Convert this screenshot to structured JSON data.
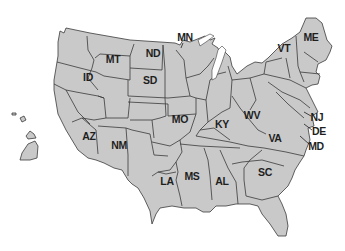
{
  "map": {
    "title": "United States map (simplified, distorted)",
    "fill_color": "#c9c9c9",
    "border_color": "#3a3a3a",
    "label_color": "#1e1e1e",
    "labels": [
      {
        "code": "MN",
        "x": 185,
        "y": 37
      },
      {
        "code": "MT",
        "x": 113,
        "y": 59
      },
      {
        "code": "ND",
        "x": 153,
        "y": 53
      },
      {
        "code": "ID",
        "x": 88,
        "y": 77
      },
      {
        "code": "SD",
        "x": 150,
        "y": 80
      },
      {
        "code": "MO",
        "x": 180,
        "y": 119
      },
      {
        "code": "KY",
        "x": 222,
        "y": 124
      },
      {
        "code": "WV",
        "x": 252,
        "y": 115
      },
      {
        "code": "VT",
        "x": 284,
        "y": 48
      },
      {
        "code": "ME",
        "x": 311,
        "y": 37
      },
      {
        "code": "NJ",
        "x": 317,
        "y": 117
      },
      {
        "code": "DE",
        "x": 319,
        "y": 131
      },
      {
        "code": "MD",
        "x": 316,
        "y": 146
      },
      {
        "code": "VA",
        "x": 275,
        "y": 138
      },
      {
        "code": "AZ",
        "x": 89,
        "y": 136
      },
      {
        "code": "NM",
        "x": 119,
        "y": 145
      },
      {
        "code": "LA",
        "x": 167,
        "y": 181
      },
      {
        "code": "MS",
        "x": 192,
        "y": 176
      },
      {
        "code": "AL",
        "x": 222,
        "y": 181
      },
      {
        "code": "SC",
        "x": 265,
        "y": 172
      }
    ]
  }
}
